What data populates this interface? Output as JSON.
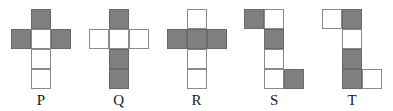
{
  "diagram": {
    "grid": {
      "columns": 3,
      "rows": 4,
      "cell_size_px": 20
    },
    "colors": {
      "shaded": "#7f7f7f",
      "blank": "#ffffff",
      "outline": "#6f6f6f",
      "background": "#ffffff",
      "label_text": "#1a1a1a"
    },
    "figures": [
      {
        "label": "P",
        "cell_count": 5,
        "shaded_count": 3,
        "blank_count": 2,
        "cells": [
          {
            "col": 1,
            "row": 0,
            "fill": "shaded"
          },
          {
            "col": 0,
            "row": 1,
            "fill": "shaded"
          },
          {
            "col": 1,
            "row": 1,
            "fill": "blank"
          },
          {
            "col": 2,
            "row": 1,
            "fill": "shaded"
          },
          {
            "col": 1,
            "row": 2,
            "fill": "blank"
          },
          {
            "col": 1,
            "row": 3,
            "fill": "blank"
          }
        ]
      },
      {
        "label": "Q",
        "cell_count": 5,
        "shaded_count": 3,
        "blank_count": 3,
        "cells": [
          {
            "col": 1,
            "row": 0,
            "fill": "shaded"
          },
          {
            "col": 0,
            "row": 1,
            "fill": "blank"
          },
          {
            "col": 1,
            "row": 1,
            "fill": "blank"
          },
          {
            "col": 2,
            "row": 1,
            "fill": "blank"
          },
          {
            "col": 1,
            "row": 2,
            "fill": "shaded"
          },
          {
            "col": 1,
            "row": 3,
            "fill": "shaded"
          }
        ]
      },
      {
        "label": "R",
        "cell_count": 5,
        "shaded_count": 3,
        "blank_count": 3,
        "cells": [
          {
            "col": 1,
            "row": 0,
            "fill": "blank"
          },
          {
            "col": 0,
            "row": 1,
            "fill": "shaded"
          },
          {
            "col": 1,
            "row": 1,
            "fill": "shaded"
          },
          {
            "col": 2,
            "row": 1,
            "fill": "shaded"
          },
          {
            "col": 1,
            "row": 2,
            "fill": "blank"
          },
          {
            "col": 1,
            "row": 3,
            "fill": "blank"
          }
        ]
      },
      {
        "label": "S",
        "cell_count": 6,
        "shaded_count": 3,
        "blank_count": 3,
        "cells": [
          {
            "col": 0,
            "row": 0,
            "fill": "shaded"
          },
          {
            "col": 1,
            "row": 0,
            "fill": "blank"
          },
          {
            "col": 1,
            "row": 1,
            "fill": "shaded"
          },
          {
            "col": 1,
            "row": 2,
            "fill": "blank"
          },
          {
            "col": 1,
            "row": 3,
            "fill": "blank"
          },
          {
            "col": 2,
            "row": 3,
            "fill": "shaded"
          }
        ]
      },
      {
        "label": "T",
        "cell_count": 6,
        "shaded_count": 3,
        "blank_count": 3,
        "cells": [
          {
            "col": 0,
            "row": 0,
            "fill": "blank"
          },
          {
            "col": 1,
            "row": 0,
            "fill": "shaded"
          },
          {
            "col": 1,
            "row": 1,
            "fill": "blank"
          },
          {
            "col": 1,
            "row": 2,
            "fill": "shaded"
          },
          {
            "col": 1,
            "row": 3,
            "fill": "shaded"
          },
          {
            "col": 2,
            "row": 3,
            "fill": "blank"
          }
        ]
      }
    ]
  }
}
